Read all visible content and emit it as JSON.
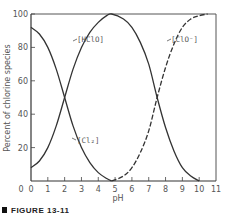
{
  "chart_data": {
    "type": "line",
    "title": "",
    "xlabel": "pH",
    "ylabel": "Percent of chlorine species",
    "xlim": [
      0,
      11
    ],
    "ylim": [
      0,
      100
    ],
    "grid": false,
    "legend": "inline labels",
    "x_ticks": [
      "0",
      "1",
      "2",
      "3",
      "4",
      "5",
      "6",
      "7",
      "8",
      "9",
      "10",
      "11"
    ],
    "y_ticks": [
      "0",
      "20",
      "40",
      "60",
      "80",
      "100"
    ],
    "series": [
      {
        "name": "[Cl2]",
        "style": "solid",
        "x": [
          0,
          0.5,
          1,
          1.5,
          2,
          2.5,
          3,
          3.5,
          4,
          4.5,
          4.8
        ],
        "values": [
          92,
          88,
          80,
          67,
          50,
          33,
          20,
          11,
          5,
          1.5,
          0
        ]
      },
      {
        "name": "[HClO]",
        "style": "solid",
        "x": [
          0,
          0.5,
          1,
          1.5,
          2,
          2.5,
          3,
          3.5,
          4,
          4.5,
          4.8,
          5.5,
          6,
          6.5,
          7,
          7.5,
          8,
          8.5,
          9,
          9.5,
          10
        ],
        "values": [
          8,
          12,
          20,
          33,
          50,
          67,
          80,
          89,
          95,
          99,
          100,
          97,
          92,
          83,
          70,
          50,
          32,
          18,
          8,
          3,
          0
        ]
      },
      {
        "name": "[ClO-]",
        "style": "dashed",
        "x": [
          4.8,
          5.5,
          6,
          6.5,
          7,
          7.5,
          8,
          8.5,
          9,
          9.5,
          10,
          10.5
        ],
        "values": [
          0,
          3,
          8,
          17,
          30,
          50,
          68,
          82,
          92,
          97,
          99,
          100
        ]
      }
    ],
    "annotations": [
      {
        "text": "[HClO]",
        "x": 2.5,
        "y": 83
      },
      {
        "text": "[ClO⁻]",
        "x": 8.6,
        "y": 83
      },
      {
        "text": "[Cl₂]",
        "x": 2.7,
        "y": 34
      }
    ]
  },
  "labels": {
    "ylabel": "Percent of chlorine species",
    "xlabel": "pH",
    "hclo": "[HClO]",
    "clo": "[ClO⁻]",
    "cl2": "[Cl₂]",
    "caption": "FIGURE 13-11"
  },
  "ticks": {
    "x": [
      "0",
      "1",
      "2",
      "3",
      "4",
      "5",
      "6",
      "7",
      "8",
      "9",
      "10",
      "11"
    ],
    "y": [
      "0",
      "20",
      "40",
      "60",
      "80",
      "100"
    ]
  },
  "colors": {
    "line": "#333333",
    "axis": "#444444",
    "text": "#555555"
  }
}
